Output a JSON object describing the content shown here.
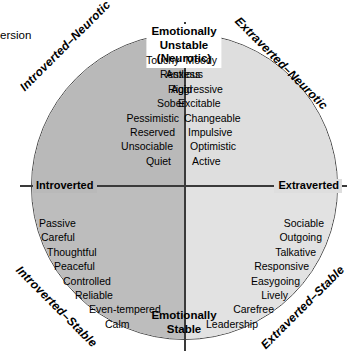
{
  "figure": {
    "edge_caption": "ersion",
    "poles": {
      "top": "Emotionally\nUnstable\n(Neurotic)",
      "top_line1": "Emotionally",
      "top_line2": "Unstable",
      "top_line3": "(Neurotic)",
      "bottom_line1": "Emotionally",
      "bottom_line2": "Stable",
      "left": "Introverted",
      "right": "Extraverted"
    },
    "diagonals": {
      "top_left": "Introverted–Neurotic",
      "top_right": "Extraverted–Neurotic",
      "bottom_left": "Introverted–Stable",
      "bottom_right": "Extraverted–Stable"
    },
    "quadrants": {
      "top_left": {
        "name": "Introverted–Neurotic",
        "fill": "#b9b9b9",
        "traits": [
          "Moody",
          "Anxious",
          "Rigid",
          "Sober",
          "Pessimistic",
          "Reserved",
          "Unsociable",
          "Quiet"
        ]
      },
      "top_right": {
        "name": "Extraverted–Neurotic",
        "fill": "#dedede",
        "traits": [
          "Touchy",
          "Restless",
          "Aggressive",
          "Excitable",
          "Changeable",
          "Impulsive",
          "Optimistic",
          "Active"
        ]
      },
      "bottom_left": {
        "name": "Introverted–Stable",
        "fill": "#bdbdbd",
        "traits": [
          "Passive",
          "Careful",
          "Thoughtful",
          "Peaceful",
          "Controlled",
          "Reliable",
          "Even-tempered",
          "Calm"
        ]
      },
      "bottom_right": {
        "name": "Extraverted–Stable",
        "fill": "#e2e2e2",
        "traits": [
          "Sociable",
          "Outgoing",
          "Talkative",
          "Responsive",
          "Easygoing",
          "Lively",
          "Carefree",
          "Leadership"
        ]
      }
    },
    "colors": {
      "outline": "#4a4a4a",
      "axis": "#3a3a3a",
      "text": "#000000",
      "background": "#ffffff"
    }
  }
}
